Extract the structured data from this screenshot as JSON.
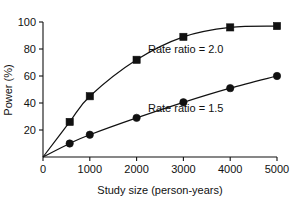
{
  "chart_data": {
    "type": "line",
    "title": "",
    "xlabel": "Study size (person-years)",
    "ylabel": "Power (%)",
    "xlim": [
      0,
      5000
    ],
    "ylim": [
      0,
      100
    ],
    "xticks": [
      0,
      1000,
      2000,
      3000,
      4000,
      5000
    ],
    "xtick_labels": [
      "0",
      "1000",
      "2000",
      "3000",
      "4000",
      "5000"
    ],
    "yticks": [
      20,
      40,
      60,
      80,
      100
    ],
    "ytick_labels": [
      "20",
      "40",
      "60",
      "80",
      "100"
    ],
    "grid": false,
    "legend_position": "inline-annotation",
    "x": [
      0,
      570,
      1000,
      2000,
      3000,
      4000,
      5000
    ],
    "series": [
      {
        "name": "Rate ratio = 2.0",
        "marker": "square",
        "values": [
          0,
          26,
          45,
          72,
          89,
          96,
          97
        ],
        "annotation": "Rate ratio = 2.0"
      },
      {
        "name": "Rate ratio = 1.5",
        "marker": "circle",
        "values": [
          0,
          10,
          16.5,
          29,
          40.5,
          51,
          60
        ],
        "annotation": "Rate ratio = 1.5"
      }
    ],
    "annotations": [
      {
        "text": "Rate ratio = 2.0",
        "x": 3050,
        "y": 77
      },
      {
        "text": "Rate ratio = 1.5",
        "x": 3050,
        "y": 33
      }
    ],
    "colors": {
      "ink": "#111111",
      "background": "#ffffff"
    }
  }
}
